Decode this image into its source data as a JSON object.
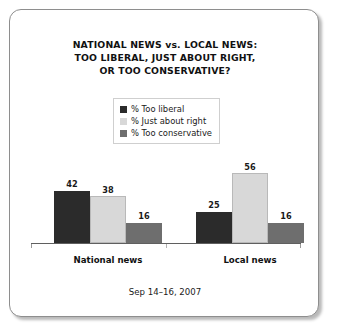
{
  "chart_data": {
    "type": "bar",
    "title": "NATIONAL NEWS vs. LOCAL NEWS: TOO LIBERAL, JUST ABOUT RIGHT, OR TOO CONSERVATIVE?",
    "title_lines": [
      "NATIONAL NEWS vs. LOCAL NEWS:",
      "TOO LIBERAL, JUST ABOUT RIGHT,",
      "OR TOO CONSERVATIVE?"
    ],
    "xlabel": "",
    "ylabel": "",
    "ylim": [
      0,
      60
    ],
    "grid": false,
    "legend_position": "upper-center",
    "categories": [
      "National news",
      "Local news"
    ],
    "series": [
      {
        "name": "% Too liberal",
        "color": "#2b2b2b",
        "values": [
          42,
          25
        ]
      },
      {
        "name": "% Just about right",
        "color": "#d8d8d8",
        "values": [
          38,
          56
        ]
      },
      {
        "name": "% Too conservative",
        "color": "#6e6e6e",
        "values": [
          16,
          16
        ]
      }
    ],
    "footnote": "Sep 14–16, 2007"
  },
  "legend": {
    "items": [
      {
        "label": "% Too liberal"
      },
      {
        "label": "% Just about right"
      },
      {
        "label": "% Too conservative"
      }
    ]
  },
  "footer": {
    "date_range": "Sep 14–16, 2007"
  }
}
